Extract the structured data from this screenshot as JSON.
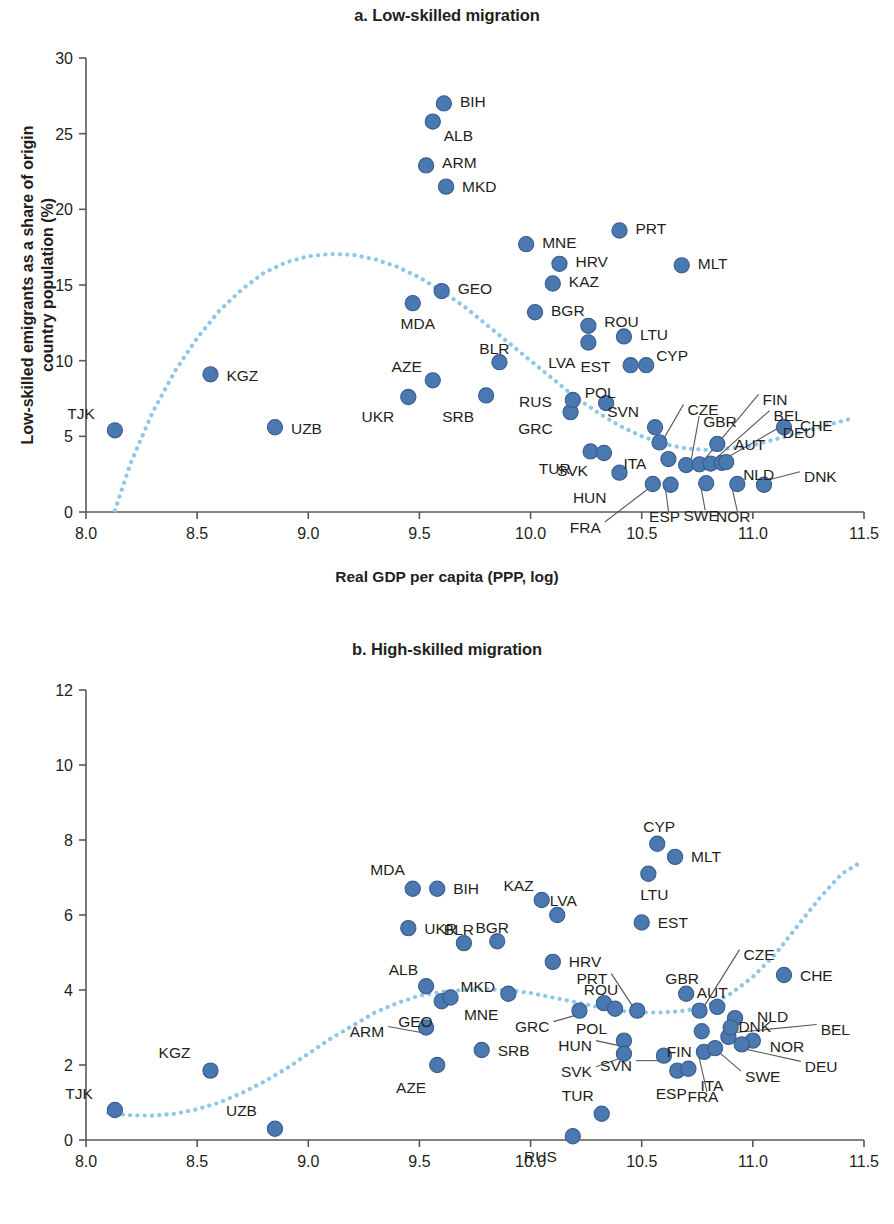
{
  "figure": {
    "marker_color": "#4a78b0",
    "marker_edge_color": "#3a5c8c",
    "trend_color": "#8fc7e8",
    "axis_color": "#58585b",
    "background": "#ffffff"
  },
  "chart_data": [
    {
      "type": "scatter",
      "panel": "a",
      "title": "a. Low-skilled migration",
      "xlabel": "Real GDP per capita (PPP, log)",
      "ylabel": "Low-skilled emigrants as a share of origin country population (%)",
      "xlim": [
        8.0,
        11.5
      ],
      "ylim": [
        0,
        30
      ],
      "xticks": [
        "8.0",
        "8.5",
        "9.0",
        "9.5",
        "10.0",
        "10.5",
        "11.0",
        "11.5"
      ],
      "yticks": [
        "0",
        "5",
        "10",
        "15",
        "20",
        "25",
        "30"
      ],
      "grid": false,
      "legend": "none",
      "trend": {
        "label": "fitted polynomial trend",
        "style": "dotted",
        "points": [
          [
            8.13,
            0.1
          ],
          [
            8.2,
            3.2
          ],
          [
            8.3,
            6.6
          ],
          [
            8.4,
            9.3
          ],
          [
            8.5,
            11.5
          ],
          [
            8.6,
            13.3
          ],
          [
            8.7,
            14.7
          ],
          [
            8.8,
            15.8
          ],
          [
            8.9,
            16.5
          ],
          [
            9.0,
            16.9
          ],
          [
            9.1,
            17.05
          ],
          [
            9.2,
            17.0
          ],
          [
            9.3,
            16.7
          ],
          [
            9.4,
            16.2
          ],
          [
            9.5,
            15.5
          ],
          [
            9.6,
            14.6
          ],
          [
            9.7,
            13.6
          ],
          [
            9.8,
            12.4
          ],
          [
            9.9,
            11.2
          ],
          [
            10.0,
            10.0
          ],
          [
            10.1,
            8.8
          ],
          [
            10.2,
            7.6
          ],
          [
            10.3,
            6.6
          ],
          [
            10.4,
            5.7
          ],
          [
            10.5,
            5.0
          ],
          [
            10.6,
            4.5
          ],
          [
            10.7,
            4.2
          ],
          [
            10.8,
            4.1
          ],
          [
            10.9,
            4.2
          ],
          [
            11.0,
            4.4
          ],
          [
            11.1,
            4.8
          ],
          [
            11.2,
            5.2
          ],
          [
            11.3,
            5.6
          ],
          [
            11.4,
            6.0
          ],
          [
            11.45,
            6.2
          ]
        ]
      },
      "points": [
        {
          "code": "TJK",
          "x": 8.13,
          "y": 5.4,
          "lx": -20,
          "ly": -17
        },
        {
          "code": "KGZ",
          "x": 8.56,
          "y": 9.1,
          "lx": 16,
          "ly": 1
        },
        {
          "code": "UZB",
          "x": 8.85,
          "y": 5.6,
          "lx": 16,
          "ly": 1
        },
        {
          "code": "UKR",
          "x": 9.45,
          "y": 7.6,
          "lx": -14,
          "ly": 20
        },
        {
          "code": "MDA",
          "x": 9.47,
          "y": 13.8,
          "lx": 5,
          "ly": 20
        },
        {
          "code": "AZE",
          "x": 9.56,
          "y": 8.7,
          "lx": -11,
          "ly": -14
        },
        {
          "code": "GEO",
          "x": 9.6,
          "y": 14.6,
          "lx": 16,
          "ly": -3
        },
        {
          "code": "ARM",
          "x": 9.53,
          "y": 22.9,
          "lx": 16,
          "ly": -3
        },
        {
          "code": "MKD",
          "x": 9.62,
          "y": 21.5,
          "lx": 16,
          "ly": 0
        },
        {
          "code": "ALB",
          "x": 9.56,
          "y": 25.8,
          "lx": 11,
          "ly": 14
        },
        {
          "code": "BIH",
          "x": 9.61,
          "y": 27.0,
          "lx": 16,
          "ly": -2
        },
        {
          "code": "SRB",
          "x": 9.8,
          "y": 7.7,
          "lx": -12,
          "ly": 21
        },
        {
          "code": "BLR",
          "x": 9.86,
          "y": 9.9,
          "lx": -5,
          "ly": -14
        },
        {
          "code": "MNE",
          "x": 9.98,
          "y": 17.7,
          "lx": 16,
          "ly": -2
        },
        {
          "code": "BGR",
          "x": 10.02,
          "y": 13.2,
          "lx": 16,
          "ly": -2
        },
        {
          "code": "GRC",
          "x": 10.18,
          "y": 6.6,
          "lx": -18,
          "ly": 16
        },
        {
          "code": "RUS",
          "x": 10.19,
          "y": 7.4,
          "lx": -21,
          "ly": 1
        },
        {
          "code": "HRV",
          "x": 10.13,
          "y": 16.4,
          "lx": 16,
          "ly": -2
        },
        {
          "code": "KAZ",
          "x": 10.1,
          "y": 15.1,
          "lx": 16,
          "ly": -2
        },
        {
          "code": "LVA",
          "x": 10.26,
          "y": 11.2,
          "lx": -13,
          "ly": 20
        },
        {
          "code": "ROU",
          "x": 10.26,
          "y": 12.3,
          "lx": 16,
          "ly": -4
        },
        {
          "code": "TUR",
          "x": 10.27,
          "y": 4.0,
          "lx": -20,
          "ly": 17
        },
        {
          "code": "SVK",
          "x": 10.33,
          "y": 3.9,
          "lx": -16,
          "ly": 18
        },
        {
          "code": "POL",
          "x": 10.34,
          "y": 7.2,
          "lx": -6,
          "ly": -11
        },
        {
          "code": "HUN",
          "x": 10.4,
          "y": 2.6,
          "lx": -13,
          "ly": 25
        },
        {
          "code": "EST",
          "x": 10.45,
          "y": 9.7,
          "lx": -20,
          "ly": 1
        },
        {
          "code": "PRT",
          "x": 10.4,
          "y": 18.6,
          "lx": 16,
          "ly": -2
        },
        {
          "code": "LTU",
          "x": 10.42,
          "y": 11.6,
          "lx": 16,
          "ly": -2
        },
        {
          "code": "CYP",
          "x": 10.52,
          "y": 9.7,
          "lx": 10,
          "ly": -10
        },
        {
          "code": "SVN",
          "x": 10.56,
          "y": 5.6,
          "lx": -16,
          "ly": -16
        },
        {
          "code": "MLT",
          "x": 10.68,
          "y": 16.3,
          "lx": 16,
          "ly": -2
        },
        {
          "code": "FRA",
          "x": 10.55,
          "y": 1.85,
          "lx": -52,
          "ly": 43
        },
        {
          "code": "ESP",
          "x": 10.63,
          "y": 1.8,
          "lx": -6,
          "ly": 32
        },
        {
          "code": "ITA",
          "x": 10.62,
          "y": 3.5,
          "lx": -22,
          "ly": 4
        },
        {
          "code": "CZE",
          "x": 10.58,
          "y": 4.6,
          "lx": 28,
          "ly": -33
        },
        {
          "code": "GBR",
          "x": 10.7,
          "y": 3.1,
          "lx": 17,
          "ly": -44
        },
        {
          "code": "FIN",
          "x": 10.76,
          "y": 3.15,
          "lx": 63,
          "ly": -65
        },
        {
          "code": "SWE",
          "x": 10.79,
          "y": 1.9,
          "lx": -5,
          "ly": 32
        },
        {
          "code": "BEL",
          "x": 10.81,
          "y": 3.2,
          "lx": 63,
          "ly": -48
        },
        {
          "code": "DEU",
          "x": 10.86,
          "y": 3.25,
          "lx": 61,
          "ly": -30
        },
        {
          "code": "AUT",
          "x": 10.84,
          "y": 4.5,
          "lx": 17,
          "ly": 1
        },
        {
          "code": "NLD",
          "x": 10.88,
          "y": 3.3,
          "lx": 17,
          "ly": 12
        },
        {
          "code": "NOR",
          "x": 10.93,
          "y": 1.85,
          "lx": -4,
          "ly": 32
        },
        {
          "code": "DNK",
          "x": 11.05,
          "y": 1.8,
          "lx": 40,
          "ly": -8
        },
        {
          "code": "CHE",
          "x": 11.14,
          "y": 5.6,
          "lx": 16,
          "ly": -2
        }
      ]
    },
    {
      "type": "scatter",
      "panel": "b",
      "title": "b. High-skilled migration",
      "xlabel": "Real GDP per capita (PPP, log)",
      "ylabel": "High-skilled emigrants as a share of origin country population (%)",
      "xlim": [
        8.0,
        11.5
      ],
      "ylim": [
        0,
        12
      ],
      "xticks": [
        "8.0",
        "8.5",
        "9.0",
        "9.5",
        "10.0",
        "10.5",
        "11.0",
        "11.5"
      ],
      "yticks": [
        "0",
        "2",
        "4",
        "6",
        "8",
        "10",
        "12"
      ],
      "grid": false,
      "legend": "none",
      "trend": {
        "label": "fitted polynomial trend",
        "style": "dotted",
        "points": [
          [
            8.1,
            0.72
          ],
          [
            8.2,
            0.66
          ],
          [
            8.3,
            0.65
          ],
          [
            8.4,
            0.7
          ],
          [
            8.5,
            0.82
          ],
          [
            8.6,
            1.0
          ],
          [
            8.7,
            1.25
          ],
          [
            8.8,
            1.55
          ],
          [
            8.9,
            1.9
          ],
          [
            9.0,
            2.3
          ],
          [
            9.1,
            2.7
          ],
          [
            9.2,
            3.05
          ],
          [
            9.3,
            3.4
          ],
          [
            9.4,
            3.65
          ],
          [
            9.5,
            3.85
          ],
          [
            9.6,
            3.95
          ],
          [
            9.7,
            4.0
          ],
          [
            9.8,
            4.02
          ],
          [
            9.9,
            4.0
          ],
          [
            10.0,
            3.92
          ],
          [
            10.1,
            3.8
          ],
          [
            10.2,
            3.68
          ],
          [
            10.3,
            3.55
          ],
          [
            10.4,
            3.45
          ],
          [
            10.5,
            3.4
          ],
          [
            10.6,
            3.4
          ],
          [
            10.7,
            3.45
          ],
          [
            10.8,
            3.6
          ],
          [
            10.9,
            3.9
          ],
          [
            11.0,
            4.35
          ],
          [
            11.1,
            4.95
          ],
          [
            11.2,
            5.7
          ],
          [
            11.3,
            6.45
          ],
          [
            11.4,
            7.1
          ],
          [
            11.47,
            7.35
          ]
        ]
      },
      "points": [
        {
          "code": "TJK",
          "x": 8.13,
          "y": 0.8,
          "lx": -22,
          "ly": -17
        },
        {
          "code": "KGZ",
          "x": 8.56,
          "y": 1.85,
          "lx": -20,
          "ly": -18
        },
        {
          "code": "UZB",
          "x": 8.85,
          "y": 0.3,
          "lx": -18,
          "ly": -18
        },
        {
          "code": "ARM",
          "x": 9.53,
          "y": 3.0,
          "lx": -42,
          "ly": 4
        },
        {
          "code": "MDA",
          "x": 9.47,
          "y": 6.7,
          "lx": -8,
          "ly": -19
        },
        {
          "code": "UKR",
          "x": 9.45,
          "y": 5.65,
          "lx": 16,
          "ly": 0
        },
        {
          "code": "BIH",
          "x": 9.58,
          "y": 6.7,
          "lx": 16,
          "ly": 0
        },
        {
          "code": "ALB",
          "x": 9.53,
          "y": 4.1,
          "lx": -8,
          "ly": -17
        },
        {
          "code": "AZE",
          "x": 9.58,
          "y": 2.0,
          "lx": -11,
          "ly": 22
        },
        {
          "code": "GEO",
          "x": 9.6,
          "y": 3.7,
          "lx": -9,
          "ly": 20
        },
        {
          "code": "MKD",
          "x": 9.64,
          "y": 3.8,
          "lx": 10,
          "ly": -11
        },
        {
          "code": "BLR",
          "x": 9.7,
          "y": 5.25,
          "lx": -5,
          "ly": -14
        },
        {
          "code": "SRB",
          "x": 9.78,
          "y": 2.4,
          "lx": 16,
          "ly": 0
        },
        {
          "code": "BGR",
          "x": 9.85,
          "y": 5.3,
          "lx": -5,
          "ly": -14
        },
        {
          "code": "MNE",
          "x": 9.9,
          "y": 3.9,
          "lx": -10,
          "ly": 21
        },
        {
          "code": "KAZ",
          "x": 10.05,
          "y": 6.4,
          "lx": -8,
          "ly": -15
        },
        {
          "code": "LVA",
          "x": 10.12,
          "y": 6.0,
          "lx": 6,
          "ly": -15
        },
        {
          "code": "HRV",
          "x": 10.1,
          "y": 4.75,
          "lx": 16,
          "ly": 0
        },
        {
          "code": "RUS",
          "x": 10.19,
          "y": 0.1,
          "lx": -16,
          "ly": 20
        },
        {
          "code": "GRC",
          "x": 10.22,
          "y": 3.45,
          "lx": -30,
          "ly": 16
        },
        {
          "code": "ROU",
          "x": 10.33,
          "y": 3.65,
          "lx": -3,
          "ly": -14
        },
        {
          "code": "POL",
          "x": 10.38,
          "y": 3.5,
          "lx": -8,
          "ly": 20
        },
        {
          "code": "TUR",
          "x": 10.32,
          "y": 0.7,
          "lx": -8,
          "ly": -18
        },
        {
          "code": "HUN",
          "x": 10.42,
          "y": 2.65,
          "lx": -32,
          "ly": 5
        },
        {
          "code": "SVK",
          "x": 10.42,
          "y": 2.3,
          "lx": -32,
          "ly": 18
        },
        {
          "code": "EST",
          "x": 10.5,
          "y": 5.8,
          "lx": 16,
          "ly": 0
        },
        {
          "code": "PRT",
          "x": 10.48,
          "y": 3.45,
          "lx": -30,
          "ly": -32
        },
        {
          "code": "LTU",
          "x": 10.53,
          "y": 7.1,
          "lx": 6,
          "ly": 21
        },
        {
          "code": "CYP",
          "x": 10.57,
          "y": 7.9,
          "lx": 2,
          "ly": -17
        },
        {
          "code": "SVN",
          "x": 10.6,
          "y": 2.25,
          "lx": -32,
          "ly": 10
        },
        {
          "code": "MLT",
          "x": 10.65,
          "y": 7.55,
          "lx": 16,
          "ly": 0
        },
        {
          "code": "GBR",
          "x": 10.7,
          "y": 3.9,
          "lx": -4,
          "ly": -15
        },
        {
          "code": "ESP",
          "x": 10.66,
          "y": 1.85,
          "lx": -6,
          "ly": 23
        },
        {
          "code": "ITA",
          "x": 10.71,
          "y": 1.9,
          "lx": 12,
          "ly": 17
        },
        {
          "code": "FIN",
          "x": 10.77,
          "y": 2.9,
          "lx": -10,
          "ly": 20
        },
        {
          "code": "FRA",
          "x": 10.78,
          "y": 2.35,
          "lx": -1,
          "ly": 45
        },
        {
          "code": "CZE",
          "x": 10.76,
          "y": 3.45,
          "lx": 44,
          "ly": -56
        },
        {
          "code": "AUT",
          "x": 10.84,
          "y": 3.55,
          "lx": -5,
          "ly": -14
        },
        {
          "code": "SWE",
          "x": 10.83,
          "y": 2.45,
          "lx": 30,
          "ly": 28
        },
        {
          "code": "DNK",
          "x": 10.89,
          "y": 2.75,
          "lx": 10,
          "ly": -10
        },
        {
          "code": "NLD",
          "x": 10.92,
          "y": 3.25,
          "lx": 22,
          "ly": -2
        },
        {
          "code": "NOR",
          "x": 11.0,
          "y": 2.65,
          "lx": 17,
          "ly": 6
        },
        {
          "code": "DEU",
          "x": 10.95,
          "y": 2.55,
          "lx": 63,
          "ly": 22
        },
        {
          "code": "BEL",
          "x": 10.9,
          "y": 3.0,
          "lx": 90,
          "ly": 2
        },
        {
          "code": "CHE",
          "x": 11.14,
          "y": 4.4,
          "lx": 16,
          "ly": 0
        }
      ]
    }
  ]
}
